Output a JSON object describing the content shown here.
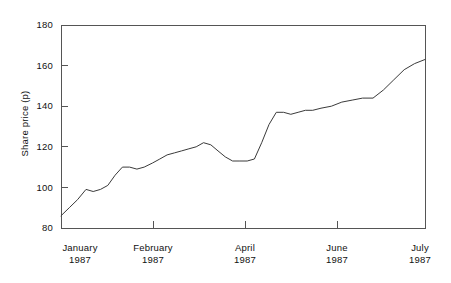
{
  "chart_data": {
    "type": "line",
    "title": "",
    "xlabel": "",
    "ylabel": "Share price (p)",
    "ylim": [
      80,
      180
    ],
    "yticks": [
      80,
      100,
      120,
      140,
      160,
      180
    ],
    "grid": false,
    "legend": null,
    "x_tick_labels": [
      {
        "month": "January",
        "year": "1987"
      },
      {
        "month": "February",
        "year": "1987"
      },
      {
        "month": "April",
        "year": "1987"
      },
      {
        "month": "June",
        "year": "1987"
      },
      {
        "month": "July",
        "year": "1987"
      }
    ],
    "series": [
      {
        "name": "Share price",
        "x": [
          0.0,
          1.6,
          3.2,
          4.8,
          6.2,
          7.6,
          9.0,
          10.4,
          11.8,
          13.2,
          14.6,
          16.0,
          17.6,
          19.0,
          20.4,
          21.8,
          23.2,
          24.6,
          26.0,
          27.4,
          28.8,
          30.2,
          31.6,
          33.0,
          34.4,
          35.8,
          37.2,
          38.6,
          40.0,
          41.4,
          42.8,
          44.2,
          45.6,
          47.0,
          48.4,
          50.0
        ],
        "values": [
          86,
          90,
          94,
          99,
          98,
          99,
          101,
          106,
          110,
          110,
          109,
          110,
          112,
          114,
          116,
          117,
          118,
          119,
          120,
          122,
          121,
          118,
          115,
          113,
          113,
          113,
          114,
          122,
          131,
          137,
          137,
          136,
          137,
          138,
          138,
          139
        ]
      }
    ],
    "line_color": "#3a3a3a",
    "axis_color": "#555555",
    "value_range": {
      "start": 86,
      "end": 163,
      "min": 86,
      "max": 163
    }
  },
  "series_points_right": {
    "x": [
      50.0,
      52.0,
      54.0,
      56.0,
      58.0,
      60.0,
      62.0,
      64.0,
      66.0,
      68.0,
      70.0
    ],
    "values": [
      139,
      140,
      142,
      143,
      144,
      144,
      148,
      153,
      158,
      161,
      163
    ]
  }
}
